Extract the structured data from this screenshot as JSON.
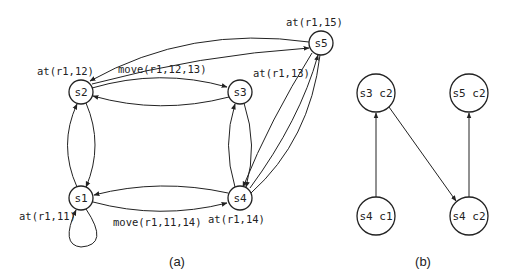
{
  "figure_a": {
    "caption": "(a)",
    "nodes": {
      "s1": {
        "label": "s1",
        "state": "at(r1,11)"
      },
      "s2": {
        "label": "s2",
        "state": "at(r1,12)"
      },
      "s3": {
        "label": "s3",
        "state": "at(r1,13)"
      },
      "s4": {
        "label": "s4",
        "state": "at(r1,14)"
      },
      "s5": {
        "label": "s5",
        "state": "at(r1,15)"
      }
    },
    "edge_labels": {
      "s2_s3": "move(r1,12,13)",
      "s1_s4": "move(r1,11,14)"
    }
  },
  "figure_b": {
    "caption": "(b)",
    "nodes": {
      "s3c2": "s3 c2",
      "s5c2": "s5 c2",
      "s4c1": "s4 c1",
      "s4c2": "s4 c2"
    }
  }
}
